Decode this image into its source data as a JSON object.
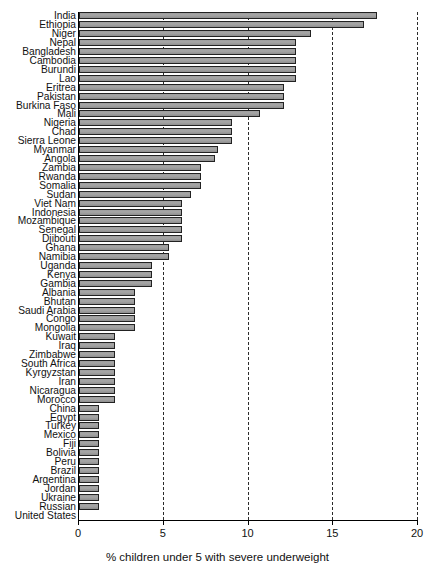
{
  "chart_data": {
    "type": "bar",
    "orientation": "horizontal",
    "title": "",
    "xlabel": "% children under 5 with severe underweight",
    "ylabel": "",
    "xlim": [
      0,
      20
    ],
    "xticks": [
      0,
      5,
      10,
      15,
      20
    ],
    "xtick_labels": [
      "0",
      "5",
      "10",
      "15",
      "20"
    ],
    "grid": "vertical dashed gridlines at 5, 10, 15, 20",
    "legend": "none",
    "bar_color": "#a0a0a0",
    "bar_edge_color": "#222222",
    "categories": [
      "India",
      "Ethiopia",
      "Niger",
      "Nepal",
      "Bangladesh",
      "Cambodia",
      "Burundi",
      "Lao",
      "Eritrea",
      "Pakistan",
      "Burkina Faso",
      "Mali",
      "Nigeria",
      "Chad",
      "Sierra Leone",
      "Myanmar",
      "Angola",
      "Zambia",
      "Rwanda",
      "Somalia",
      "Sudan",
      "Viet Nam",
      "Indonesia",
      "Mozambique",
      "Senegal",
      "Djibouti",
      "Ghana",
      "Namibia",
      "Uganda",
      "Kenya",
      "Gambia",
      "Albania",
      "Bhutan",
      "Saudi Arabia",
      "Congo",
      "Mongolia",
      "Kuwait",
      "Iraq",
      "Zimbabwe",
      "South Africa",
      "Kyrgyzstan",
      "Iran",
      "Nicaragua",
      "Morocco",
      "China",
      "Egypt",
      "Turkey",
      "Mexico",
      "Fiji",
      "Bolivia",
      "Peru",
      "Brazil",
      "Argentina",
      "Jordan",
      "Ukraine",
      "Russian",
      "United States"
    ],
    "values": [
      17.6,
      16.8,
      13.7,
      12.8,
      12.8,
      12.8,
      12.8,
      12.8,
      12.1,
      12.1,
      12.1,
      10.7,
      9.0,
      9.0,
      9.0,
      8.2,
      8.0,
      7.2,
      7.2,
      7.2,
      6.6,
      6.1,
      6.1,
      6.1,
      6.1,
      6.1,
      5.3,
      5.3,
      4.3,
      4.3,
      4.3,
      3.3,
      3.3,
      3.3,
      3.3,
      3.3,
      2.1,
      2.1,
      2.1,
      2.1,
      2.1,
      2.1,
      2.1,
      2.1,
      1.2,
      1.2,
      1.2,
      1.2,
      1.2,
      1.2,
      1.2,
      1.2,
      1.2,
      1.2,
      1.2,
      1.2,
      0.0
    ]
  }
}
